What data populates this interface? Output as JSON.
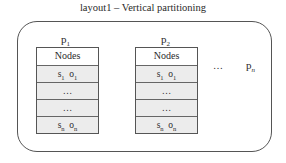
{
  "title": "layout1 – Vertical partitioning",
  "partitions": [
    {
      "label": "p",
      "sub": "1",
      "rows": [
        {
          "a": "Nodes",
          "asub": "",
          "b": "",
          "bsub": ""
        },
        {
          "a": "s",
          "asub": "1",
          "b": "o",
          "bsub": "1"
        },
        {
          "a": "…",
          "asub": "",
          "b": "",
          "bsub": ""
        },
        {
          "a": "…",
          "asub": "",
          "b": "",
          "bsub": ""
        },
        {
          "a": "s",
          "asub": "n",
          "b": "o",
          "bsub": "n"
        }
      ]
    },
    {
      "label": "p",
      "sub": "2",
      "rows": [
        {
          "a": "Nodes",
          "asub": "",
          "b": "",
          "bsub": ""
        },
        {
          "a": "s",
          "asub": "1",
          "b": "o",
          "bsub": "1"
        },
        {
          "a": "…",
          "asub": "",
          "b": "",
          "bsub": ""
        },
        {
          "a": "…",
          "asub": "",
          "b": "",
          "bsub": ""
        },
        {
          "a": "s",
          "asub": "n",
          "b": "o",
          "bsub": "n"
        }
      ]
    }
  ],
  "ellipsis": "…",
  "last_partition": {
    "label": "p",
    "sub": "n"
  }
}
